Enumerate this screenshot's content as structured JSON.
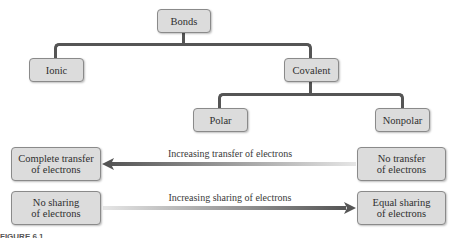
{
  "diagram": {
    "root": {
      "label": "Bonds"
    },
    "level1": [
      {
        "label": "Ionic"
      },
      {
        "label": "Covalent"
      }
    ],
    "level2": [
      {
        "label": "Polar"
      },
      {
        "label": "Nonpolar"
      }
    ],
    "transfer_row": {
      "left": {
        "line1": "Complete transfer",
        "line2": "of electrons"
      },
      "right": {
        "line1": "No transfer",
        "line2": "of electrons"
      },
      "arrow_label": "Increasing transfer of electrons",
      "arrow_direction": "left"
    },
    "sharing_row": {
      "left": {
        "line1": "No sharing",
        "line2": "of electrons"
      },
      "right": {
        "line1": "Equal sharing",
        "line2": "of electrons"
      },
      "arrow_label": "Increasing sharing of electrons",
      "arrow_direction": "right"
    },
    "caption": "FIGURE 6.1"
  },
  "colors": {
    "box_fill": "#dcdcdc",
    "box_border": "#8a8a8a",
    "connector": "#555555",
    "arrow_dark": "#555555",
    "arrow_light": "#e6e6e6"
  }
}
